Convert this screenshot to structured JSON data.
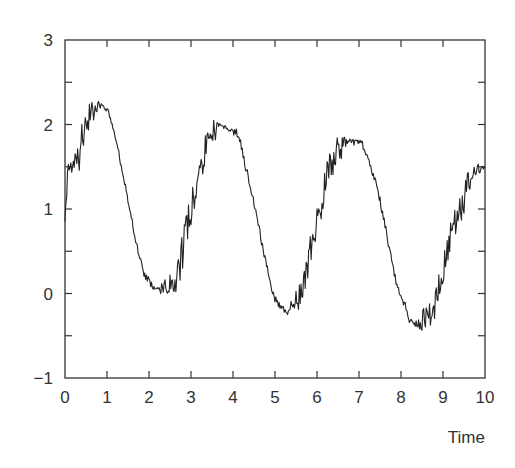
{
  "chart_data": {
    "type": "line",
    "title": "",
    "xlabel": "Time",
    "ylabel": "",
    "xlim": [
      0,
      10
    ],
    "ylim": [
      -1,
      3
    ],
    "x_ticks": [
      "0",
      "1",
      "2",
      "3",
      "4",
      "5",
      "6",
      "7",
      "8",
      "9",
      "10"
    ],
    "y_ticks": [
      "-1",
      "0",
      "1",
      "2",
      "3"
    ],
    "grid": false,
    "legend": null,
    "series": [
      {
        "name": "signal",
        "color": "#222222",
        "description": "Noisy oscillating signal, period ~3.1, peaks ~2.2 (t≈0.8), ~1.95 (t≈4.0), ~1.8 (t≈7.0); troughs ~0.05 (t≈2.4), ~-0.2 (t≈5.5), ~-0.35 (t≈8.7)",
        "x": [
          0.0,
          0.1,
          0.2,
          0.3,
          0.4,
          0.5,
          0.6,
          0.7,
          0.8,
          0.9,
          1.0,
          1.1,
          1.2,
          1.3,
          1.4,
          1.5,
          1.6,
          1.7,
          1.8,
          1.9,
          2.0,
          2.1,
          2.2,
          2.3,
          2.4,
          2.5,
          2.6,
          2.7,
          2.8,
          2.9,
          3.0,
          3.1,
          3.2,
          3.3,
          3.4,
          3.5,
          3.6,
          3.7,
          3.8,
          3.9,
          4.0,
          4.1,
          4.2,
          4.3,
          4.4,
          4.5,
          4.6,
          4.7,
          4.8,
          4.9,
          5.0,
          5.1,
          5.2,
          5.3,
          5.4,
          5.5,
          5.6,
          5.7,
          5.8,
          5.9,
          6.0,
          6.1,
          6.2,
          6.3,
          6.4,
          6.5,
          6.6,
          6.7,
          6.8,
          6.9,
          7.0,
          7.1,
          7.2,
          7.3,
          7.4,
          7.5,
          7.6,
          7.7,
          7.8,
          7.9,
          8.0,
          8.1,
          8.2,
          8.3,
          8.4,
          8.5,
          8.6,
          8.7,
          8.8,
          8.9,
          9.0,
          9.1,
          9.2,
          9.3,
          9.4,
          9.5,
          9.6,
          9.7,
          9.8,
          9.9,
          10.0
        ],
        "y": [
          1.15,
          1.45,
          1.5,
          1.6,
          1.85,
          1.95,
          2.1,
          2.2,
          2.25,
          2.22,
          2.2,
          2.05,
          1.85,
          1.6,
          1.35,
          1.1,
          0.85,
          0.6,
          0.4,
          0.2,
          0.15,
          0.1,
          0.05,
          0.0,
          0.05,
          0.05,
          0.15,
          0.3,
          0.5,
          0.75,
          0.95,
          1.2,
          1.4,
          1.6,
          1.75,
          1.85,
          1.95,
          2.0,
          2.0,
          1.95,
          1.9,
          1.9,
          1.75,
          1.5,
          1.3,
          1.05,
          0.85,
          0.55,
          0.35,
          0.1,
          -0.05,
          -0.15,
          -0.2,
          -0.22,
          -0.15,
          -0.15,
          -0.05,
          0.15,
          0.35,
          0.6,
          0.8,
          1.05,
          1.3,
          1.5,
          1.6,
          1.7,
          1.75,
          1.8,
          1.8,
          1.8,
          1.8,
          1.75,
          1.6,
          1.45,
          1.3,
          1.1,
          0.85,
          0.6,
          0.35,
          0.1,
          -0.05,
          -0.15,
          -0.3,
          -0.35,
          -0.35,
          -0.3,
          -0.25,
          -0.2,
          -0.1,
          0.05,
          0.25,
          0.45,
          0.65,
          0.85,
          1.0,
          1.15,
          1.3,
          1.4,
          1.45,
          1.5,
          1.5
        ]
      }
    ]
  },
  "axes": {
    "x_tick_labels": [
      "0",
      "1",
      "2",
      "3",
      "4",
      "5",
      "6",
      "7",
      "8",
      "9",
      "10"
    ],
    "y_tick_labels": [
      "-1",
      "0",
      "1",
      "2",
      "3"
    ],
    "xlabel": "Time"
  }
}
